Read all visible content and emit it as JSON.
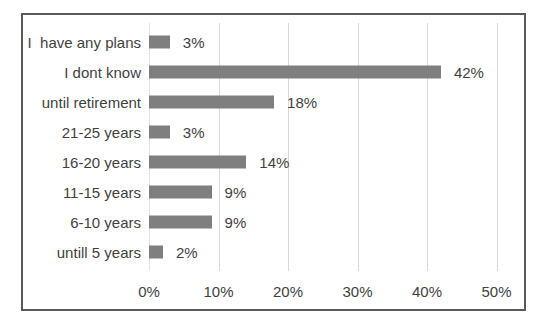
{
  "chart_data": {
    "type": "bar",
    "orientation": "horizontal",
    "title": "",
    "xlabel": "",
    "ylabel": "",
    "categories": [
      "I  have any plans",
      "I dont know",
      "until retirement",
      "21-25 years",
      "16-20 years",
      "11-15 years",
      "6-10 years",
      "untill 5 years"
    ],
    "values": [
      3,
      42,
      18,
      3,
      14,
      9,
      9,
      2
    ],
    "value_labels": [
      "3%",
      "42%",
      "18%",
      "3%",
      "14%",
      "9%",
      "9%",
      "2%"
    ],
    "x_ticks": [
      "0%",
      "10%",
      "20%",
      "30%",
      "40%",
      "50%"
    ],
    "x_tick_values": [
      0,
      10,
      20,
      30,
      40,
      50
    ],
    "xlim": [
      0,
      50
    ],
    "grid": true,
    "legend": "none",
    "colors": {
      "bar": "#7f7f7f",
      "gridline": "#d9d9d9",
      "frame_border": "#595959",
      "text": "#3f3f3f",
      "background": "#ffffff"
    }
  }
}
